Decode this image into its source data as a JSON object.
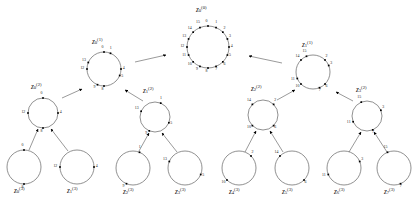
{
  "figure": {
    "type": "tree-diagram",
    "background_color": "#ffffff",
    "stroke_color": "#555555",
    "point_color": "#000000",
    "levels": 4
  },
  "nodes": [
    {
      "id": "n0",
      "label_base": "z",
      "label_sub": "0",
      "label_sup": "(0)",
      "level": 0,
      "cx": 208,
      "cy": 47,
      "r": 21,
      "label_x": 196,
      "label_y": 6,
      "label_align": "left",
      "points": [
        0,
        1,
        2,
        3,
        4,
        5,
        6,
        7,
        8,
        9,
        10,
        11,
        12,
        13,
        14,
        15
      ],
      "total_slots": 16,
      "start_angle": -90
    },
    {
      "id": "n1",
      "label_base": "z",
      "label_sub": "0",
      "label_sup": "(1)",
      "level": 1,
      "cx": 104,
      "cy": 69,
      "r": 17,
      "label_x": 92,
      "label_y": 38,
      "label_align": "left",
      "points": [
        0,
        1,
        4,
        5,
        8,
        9,
        12,
        13
      ],
      "total_slots": 16,
      "start_angle": -90
    },
    {
      "id": "n2",
      "label_base": "z",
      "label_sub": "1",
      "label_sup": "(1)",
      "level": 1,
      "cx": 313,
      "cy": 72,
      "r": 17,
      "label_x": 302,
      "label_y": 41,
      "label_align": "left",
      "points": [
        2,
        3,
        6,
        7,
        10,
        11,
        14,
        15
      ],
      "total_slots": 16,
      "start_angle": -90
    },
    {
      "id": "n3",
      "label_base": "z",
      "label_sub": "0",
      "label_sup": "(2)",
      "level": 2,
      "cx": 43,
      "cy": 113,
      "r": 15,
      "label_x": 31,
      "label_y": 83,
      "label_align": "left",
      "points": [
        0,
        4,
        8,
        12
      ],
      "total_slots": 16,
      "start_angle": -90
    },
    {
      "id": "n4",
      "label_base": "z",
      "label_sub": "1",
      "label_sup": "(2)",
      "level": 2,
      "cx": 155,
      "cy": 117,
      "r": 15,
      "label_x": 143,
      "label_y": 87,
      "label_align": "left",
      "points": [
        1,
        5,
        9,
        13
      ],
      "total_slots": 16,
      "start_angle": -90
    },
    {
      "id": "n5",
      "label_base": "z",
      "label_sub": "2",
      "label_sup": "(2)",
      "level": 2,
      "cx": 263,
      "cy": 115,
      "r": 15,
      "label_x": 251,
      "label_y": 85,
      "label_align": "left",
      "points": [
        2,
        6,
        10,
        14
      ],
      "total_slots": 16,
      "start_angle": -90
    },
    {
      "id": "n6",
      "label_base": "z",
      "label_sub": "3",
      "label_sup": "(2)",
      "level": 2,
      "cx": 367,
      "cy": 116,
      "r": 15,
      "label_x": 356,
      "label_y": 86,
      "label_align": "left",
      "points": [
        3,
        7,
        11,
        15
      ],
      "total_slots": 16,
      "start_angle": -90
    },
    {
      "id": "n7",
      "label_base": "z",
      "label_sub": "0",
      "label_sup": "(3)",
      "level": 3,
      "cx": 24,
      "cy": 167,
      "r": 17,
      "label_x": 14,
      "label_y": 187,
      "label_align": "left",
      "points": [
        0,
        8
      ],
      "total_slots": 16,
      "start_angle": -90
    },
    {
      "id": "n8",
      "label_base": "z",
      "label_sub": "1",
      "label_sup": "(3)",
      "level": 3,
      "cx": 77,
      "cy": 167,
      "r": 17,
      "label_x": 67,
      "label_y": 187,
      "label_align": "left",
      "points": [
        4,
        12
      ],
      "total_slots": 16,
      "start_angle": -90
    },
    {
      "id": "n9",
      "label_base": "z",
      "label_sub": "2",
      "label_sup": "(3)",
      "level": 3,
      "cx": 133,
      "cy": 168,
      "r": 17,
      "label_x": 123,
      "label_y": 188,
      "label_align": "left",
      "points": [
        1,
        9
      ],
      "total_slots": 16,
      "start_angle": -90
    },
    {
      "id": "n10",
      "label_base": "z",
      "label_sub": "3",
      "label_sup": "(3)",
      "level": 3,
      "cx": 185,
      "cy": 168,
      "r": 17,
      "label_x": 175,
      "label_y": 188,
      "label_align": "left",
      "points": [
        5,
        13
      ],
      "total_slots": 16,
      "start_angle": -90
    },
    {
      "id": "n11",
      "label_base": "z",
      "label_sub": "4",
      "label_sup": "(3)",
      "level": 3,
      "cx": 239,
      "cy": 168,
      "r": 17,
      "label_x": 229,
      "label_y": 188,
      "label_align": "left",
      "points": [
        2,
        10
      ],
      "total_slots": 16,
      "start_angle": -90
    },
    {
      "id": "n12",
      "label_base": "z",
      "label_sub": "5",
      "label_sup": "(3)",
      "level": 3,
      "cx": 292,
      "cy": 168,
      "r": 17,
      "label_x": 282,
      "label_y": 188,
      "label_align": "left",
      "points": [
        6,
        14
      ],
      "total_slots": 16,
      "start_angle": -90
    },
    {
      "id": "n13",
      "label_base": "z",
      "label_sub": "6",
      "label_sup": "(3)",
      "level": 3,
      "cx": 344,
      "cy": 168,
      "r": 17,
      "label_x": 334,
      "label_y": 188,
      "label_align": "left",
      "points": [
        3,
        11
      ],
      "total_slots": 16,
      "start_angle": -90
    },
    {
      "id": "n14",
      "label_base": "z",
      "label_sub": "7",
      "label_sup": "(3)",
      "level": 3,
      "cx": 394,
      "cy": 168,
      "r": 17,
      "label_x": 384,
      "label_y": 188,
      "label_align": "left",
      "points": [
        7,
        15
      ],
      "total_slots": 16,
      "start_angle": -90
    }
  ],
  "arrows": [
    {
      "id": "a1",
      "from": "n1",
      "to": "n0",
      "x1": 135,
      "y1": 62,
      "x2": 166,
      "y2": 55
    },
    {
      "id": "a2",
      "from": "n2",
      "to": "n0",
      "x1": 282,
      "y1": 63,
      "x2": 249,
      "y2": 56
    },
    {
      "id": "a3",
      "from": "n3",
      "to": "n1",
      "x1": 62,
      "y1": 98,
      "x2": 82,
      "y2": 89
    },
    {
      "id": "a4",
      "from": "n4",
      "to": "n1",
      "x1": 143,
      "y1": 101,
      "x2": 125,
      "y2": 90
    },
    {
      "id": "a5",
      "from": "n5",
      "to": "n2",
      "x1": 277,
      "y1": 100,
      "x2": 295,
      "y2": 90
    },
    {
      "id": "a6",
      "from": "n6",
      "to": "n2",
      "x1": 353,
      "y1": 101,
      "x2": 336,
      "y2": 92
    },
    {
      "id": "a7",
      "from": "n7",
      "to": "n3",
      "x1": 29,
      "y1": 150,
      "x2": 38,
      "y2": 129
    },
    {
      "id": "a8",
      "from": "n8",
      "to": "n3",
      "x1": 68,
      "y1": 151,
      "x2": 51,
      "y2": 129
    },
    {
      "id": "a9",
      "from": "n9",
      "to": "n4",
      "x1": 139,
      "y1": 151,
      "x2": 149,
      "y2": 133
    },
    {
      "id": "a10",
      "from": "n10",
      "to": "n4",
      "x1": 177,
      "y1": 152,
      "x2": 162,
      "y2": 133
    },
    {
      "id": "a11",
      "from": "n11",
      "to": "n5",
      "x1": 245,
      "y1": 152,
      "x2": 256,
      "y2": 131
    },
    {
      "id": "a12",
      "from": "n12",
      "to": "n5",
      "x1": 283,
      "y1": 152,
      "x2": 270,
      "y2": 131
    },
    {
      "id": "a13",
      "from": "n13",
      "to": "n6",
      "x1": 349,
      "y1": 152,
      "x2": 361,
      "y2": 132
    },
    {
      "id": "a14",
      "from": "n14",
      "to": "n6",
      "x1": 387,
      "y1": 152,
      "x2": 374,
      "y2": 132
    }
  ]
}
